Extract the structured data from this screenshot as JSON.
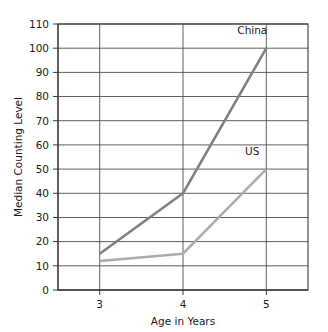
{
  "chart_data": {
    "type": "line",
    "title": "",
    "subtitle": "",
    "xlabel": "Age in Years",
    "ylabel": "Median Counting Level",
    "x": [
      3,
      4,
      5
    ],
    "xtick_labels": [
      "3",
      "4",
      "5"
    ],
    "xlim": [
      2.5,
      5.5
    ],
    "ylim": [
      0,
      110
    ],
    "ytick_labels": [
      "0",
      "10",
      "20",
      "30",
      "40",
      "50",
      "60",
      "70",
      "80",
      "90",
      "100",
      "110"
    ],
    "ytick_values": [
      0,
      10,
      20,
      30,
      40,
      50,
      60,
      70,
      80,
      90,
      100,
      110
    ],
    "grid": "both",
    "legend_position": "inline-annotations",
    "series": [
      {
        "name": "China",
        "values": [
          15,
          40,
          100
        ],
        "color": "#808080",
        "label": "China",
        "label_x": 5,
        "label_y": 106
      },
      {
        "name": "US",
        "values": [
          12,
          15,
          50
        ],
        "color": "#ababab",
        "label": "US",
        "label_x": 5,
        "label_y": 56
      }
    ],
    "annotations": [
      "China",
      "US"
    ],
    "grid_color": "#4d4d4d",
    "frame_color": "#3a3a3a",
    "background_color": "#ffffff"
  }
}
